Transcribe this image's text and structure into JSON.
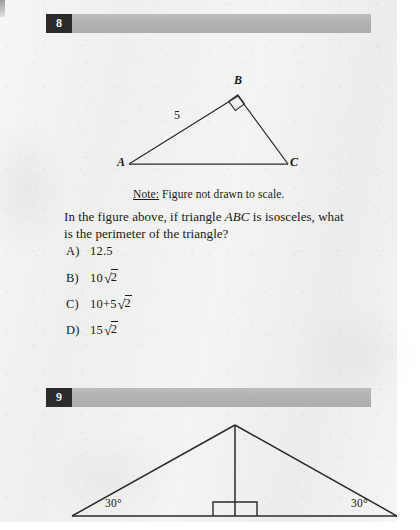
{
  "page": {
    "background_color": "#f2f2f0",
    "bar_color": "#b2b2b2",
    "number_box_color": "#2b2b2b",
    "ink_color": "#1a1a1a"
  },
  "questions": [
    {
      "number": "8",
      "figure": {
        "kind": "triangle",
        "vertex_labels": [
          "A",
          "B",
          "C"
        ],
        "side_labels": [
          "5"
        ],
        "right_angle_at": "B",
        "note": {
          "prefix": "Note:",
          "text": " Figure not drawn to scale."
        }
      },
      "prompt_line_1": "In the figure above, if triangle ABC is isosceles, what",
      "prompt_line_2": "is the perimeter of the triangle?",
      "prompt_italic_token": "ABC",
      "choices": [
        {
          "letter": "A)",
          "value": "12.5",
          "coefficient": "12.5",
          "radicand": "",
          "prefix": ""
        },
        {
          "letter": "B)",
          "value": "10√2",
          "coefficient": "10",
          "radicand": "2",
          "prefix": ""
        },
        {
          "letter": "C)",
          "value": "10+5√2",
          "coefficient": "5",
          "radicand": "2",
          "prefix": "10+"
        },
        {
          "letter": "D)",
          "value": "15√2",
          "coefficient": "15",
          "radicand": "2",
          "prefix": ""
        }
      ]
    },
    {
      "number": "9",
      "figure": {
        "kind": "isosceles-triangle-with-altitude",
        "angle_left": "30°",
        "angle_right": "30°",
        "has_right_angle_marker": true
      }
    }
  ]
}
